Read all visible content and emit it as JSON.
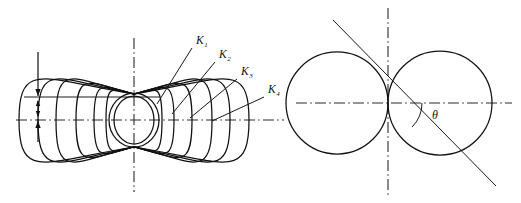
{
  "figure": {
    "background_color": "#ffffff",
    "stroke_color": "#111111",
    "axis_color": "#2a2a2a",
    "left_panel": {
      "name": "field-line-family-diagram",
      "description": "Family of nested closed curves (Apollonius / dipole field lines) meeting at two nodal points on the vertical axis, with horizontal and vertical dash-dot axes and a dimension arrow at the left.",
      "center": {
        "x": 134,
        "y": 120
      },
      "node_top": {
        "x": 134,
        "y": 94
      },
      "node_bottom": {
        "x": 134,
        "y": 147
      },
      "horizontal_axis": {
        "x1": 16,
        "y1": 120,
        "x2": 284,
        "y2": 120
      },
      "vertical_axis": {
        "x1": 134,
        "y1": 38,
        "x2": 134,
        "y2": 192
      },
      "dimension": {
        "x": 38,
        "top_arrow_y": 52,
        "reference_line_y": 97,
        "bottom_axis_y": 120,
        "reference_line_x1": 24,
        "reference_line_x2": 160
      },
      "curves": [
        {
          "label": "K1",
          "half_width": 28,
          "outer": false
        },
        {
          "label": "K2",
          "half_width": 40,
          "outer": false
        },
        {
          "label": "K3",
          "half_width": 58,
          "outer": false
        },
        {
          "label": "K4",
          "half_width": 78,
          "outer": false
        },
        {
          "label": "",
          "half_width": 96,
          "outer": true
        },
        {
          "label": "",
          "half_width": 115,
          "outer": true
        }
      ],
      "labels": [
        {
          "text": "K",
          "sub": "1",
          "x": 196,
          "y": 44,
          "leader_x1": 192,
          "leader_y1": 48,
          "leader_x2": 157,
          "leader_y2": 104
        },
        {
          "text": "K",
          "sub": "2",
          "x": 219,
          "y": 58,
          "leader_x1": 215,
          "leader_y1": 62,
          "leader_x2": 172,
          "leader_y2": 114
        },
        {
          "text": "K",
          "sub": "3",
          "x": 241,
          "y": 75,
          "leader_x1": 237,
          "leader_y1": 79,
          "leader_x2": 190,
          "leader_y2": 118
        },
        {
          "text": "K",
          "sub": "4",
          "x": 268,
          "y": 93,
          "leader_x1": 264,
          "leader_y1": 97,
          "leader_x2": 212,
          "leader_y2": 121
        }
      ]
    },
    "right_panel": {
      "name": "cardioid-two-circle-diagram",
      "description": "Two tangent circles (small left circle and large right circle) touching at the origin, crossed by an inclined straight line and dash-dot coordinate axes, with the angle theta marked between the horizontal axis and the descending line.",
      "origin": {
        "x": 388,
        "y": 103
      },
      "small_circle": {
        "cx": 337,
        "cy": 103,
        "r": 51
      },
      "large_circle": {
        "cx": 440,
        "cy": 103,
        "r": 52
      },
      "horizontal_axis": {
        "x1": 296,
        "y1": 103,
        "x2": 512,
        "y2": 103
      },
      "vertical_axis": {
        "x1": 388,
        "y1": 8,
        "x2": 388,
        "y2": 196
      },
      "inclined_line": {
        "x1": 333,
        "y1": 20,
        "x2": 496,
        "y2": 186
      },
      "theta_arc": {
        "radius": 34,
        "start_deg": 0,
        "end_deg": 45
      },
      "theta_label": {
        "text": "θ",
        "x": 432,
        "y": 119
      }
    }
  }
}
